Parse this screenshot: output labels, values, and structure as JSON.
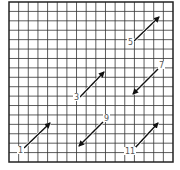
{
  "grid": {
    "x0": 9,
    "y0": 2,
    "x1": 173,
    "y1": 162,
    "cols": 17,
    "rows": 17,
    "line_color": "#333333",
    "border_color": "#222222"
  },
  "arrows": [
    {
      "label": "1",
      "x1": 24,
      "y1": 148,
      "x2": 50,
      "y2": 123,
      "lx": 18,
      "ly": 153
    },
    {
      "label": "3",
      "x1": 80,
      "y1": 97,
      "x2": 104,
      "y2": 72,
      "lx": 74,
      "ly": 100
    },
    {
      "label": "5",
      "x1": 134,
      "y1": 41,
      "x2": 159,
      "y2": 17,
      "lx": 128,
      "ly": 45
    },
    {
      "label": "7",
      "x1": 158,
      "y1": 69,
      "x2": 133,
      "y2": 94,
      "lx": 159,
      "ly": 68
    },
    {
      "label": "9",
      "x1": 103,
      "y1": 122,
      "x2": 79,
      "y2": 146,
      "lx": 104,
      "ly": 121
    },
    {
      "label": "11",
      "x1": 134,
      "y1": 149,
      "x2": 158,
      "y2": 123,
      "lx": 125,
      "ly": 154
    }
  ]
}
